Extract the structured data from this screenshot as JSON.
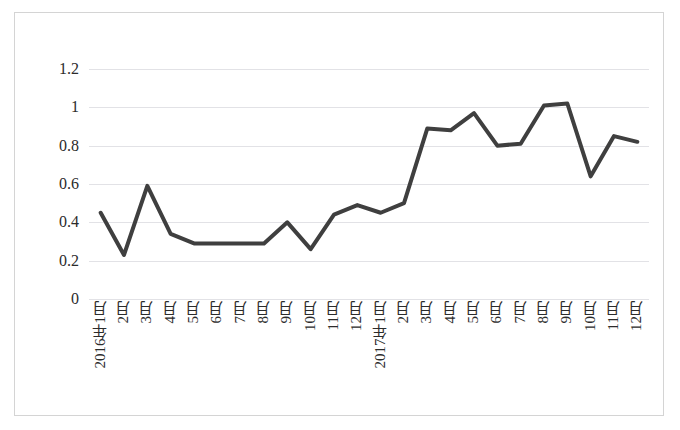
{
  "chart_data": {
    "type": "line",
    "title": "",
    "xlabel": "",
    "ylabel": "",
    "ylim": [
      0,
      1.2
    ],
    "grid": true,
    "legend": "none",
    "line_color": "#3f3f3f",
    "gridline_color": "#e2e2e6",
    "border_color": "#d4d4d4",
    "ytick_labels": [
      "1.2",
      "1",
      "0.8",
      "0.6",
      "0.4",
      "0.2",
      "0"
    ],
    "ytick_values": [
      1.2,
      1.0,
      0.8,
      0.6,
      0.4,
      0.2,
      0
    ],
    "categories": [
      "2016年1月",
      "2月",
      "3月",
      "4月",
      "5月",
      "6月",
      "7月",
      "8月",
      "9月",
      "10月",
      "11月",
      "12月",
      "2017年1月",
      "2月",
      "3月",
      "4月",
      "5月",
      "6月",
      "7月",
      "8月",
      "9月",
      "10月",
      "11月",
      "12月"
    ],
    "values": [
      0.45,
      0.23,
      0.59,
      0.34,
      0.29,
      0.29,
      0.29,
      0.29,
      0.4,
      0.26,
      0.44,
      0.49,
      0.45,
      0.5,
      0.89,
      0.88,
      0.97,
      0.8,
      0.81,
      1.01,
      1.02,
      0.64,
      0.85,
      0.82
    ]
  }
}
